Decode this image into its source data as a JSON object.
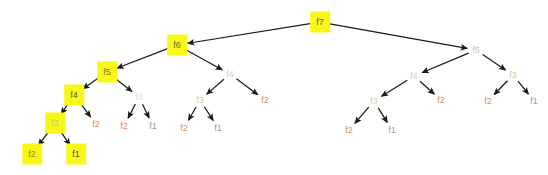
{
  "figure": {
    "kind": "recursion-tree",
    "background": "#ffffff",
    "edge_color": "#1a1a1a",
    "highlight_color": "#f7f718"
  },
  "palette": {
    "highlight_bg": "#f7f718",
    "label_f7": "#6b6b20",
    "label_f6": "#6b6b20",
    "label_f5_hl": "#7a7a28",
    "label_f4_hl": "#5c5c1a",
    "label_f3_hl": "#c9c95a",
    "label_f2_hl": "#b8741f",
    "label_f1_hl": "#4a4a4a",
    "label_f5_plain": "#b8c4cc",
    "label_f4_plain": "#d8cfae",
    "label_f3_plain": "#e0c9a0",
    "label_f2_plain": "#e08a6a",
    "label_f1_plain": "#9a9a9a"
  },
  "nodes": [
    {
      "id": "n0",
      "label": "f7",
      "x": 320,
      "y": 22,
      "highlight": true,
      "color": "#6b6b20"
    },
    {
      "id": "n1",
      "label": "f6",
      "x": 177,
      "y": 45,
      "highlight": true,
      "color": "#6b6b20"
    },
    {
      "id": "n2",
      "label": "f5",
      "x": 476,
      "y": 50,
      "highlight": false,
      "color": "#b8c4cc"
    },
    {
      "id": "n3",
      "label": "f5",
      "x": 107,
      "y": 72,
      "highlight": true,
      "color": "#7a7a28"
    },
    {
      "id": "n4",
      "label": "f4",
      "x": 230,
      "y": 74,
      "highlight": false,
      "color": "#d8cfae"
    },
    {
      "id": "n5",
      "label": "f4",
      "x": 414,
      "y": 76,
      "highlight": false,
      "color": "#d8cfae"
    },
    {
      "id": "n6",
      "label": "f3",
      "x": 513,
      "y": 75,
      "highlight": false,
      "color": "#e0c9a0"
    },
    {
      "id": "n7",
      "label": "f4",
      "x": 74,
      "y": 95,
      "highlight": true,
      "color": "#5c5c1a"
    },
    {
      "id": "n8",
      "label": "f3",
      "x": 139,
      "y": 97,
      "highlight": false,
      "color": "#e8dcb8"
    },
    {
      "id": "n9",
      "label": "f3",
      "x": 200,
      "y": 100,
      "highlight": false,
      "color": "#e0c9a0"
    },
    {
      "id": "n10",
      "label": "f2",
      "x": 265,
      "y": 100,
      "highlight": false,
      "color": "#e08a6a"
    },
    {
      "id": "n11",
      "label": "f3",
      "x": 374,
      "y": 101,
      "highlight": false,
      "color": "#e0c9a0"
    },
    {
      "id": "n12",
      "label": "f2",
      "x": 441,
      "y": 100,
      "highlight": false,
      "color": "#e08a6a"
    },
    {
      "id": "n13",
      "label": "f2",
      "x": 488,
      "y": 101,
      "highlight": false,
      "color": "#e08a6a"
    },
    {
      "id": "n14",
      "label": "f1",
      "x": 534,
      "y": 101,
      "highlight": false,
      "color": "#9a9a9a"
    },
    {
      "id": "n15",
      "label": "f3",
      "x": 55,
      "y": 123,
      "highlight": true,
      "color": "#c9c95a"
    },
    {
      "id": "n16",
      "label": "f2",
      "x": 96,
      "y": 124,
      "highlight": false,
      "color": "#e08a6a"
    },
    {
      "id": "n17",
      "label": "f2",
      "x": 124,
      "y": 126,
      "highlight": false,
      "color": "#e08a6a"
    },
    {
      "id": "n18",
      "label": "f1",
      "x": 153,
      "y": 126,
      "highlight": false,
      "color": "#9a9a9a"
    },
    {
      "id": "n19",
      "label": "f2",
      "x": 184,
      "y": 128,
      "highlight": false,
      "color": "#e08a6a"
    },
    {
      "id": "n20",
      "label": "f1",
      "x": 218,
      "y": 128,
      "highlight": false,
      "color": "#9a9a9a"
    },
    {
      "id": "n21",
      "label": "f2",
      "x": 349,
      "y": 130,
      "highlight": false,
      "color": "#e08a6a"
    },
    {
      "id": "n22",
      "label": "f1",
      "x": 392,
      "y": 130,
      "highlight": false,
      "color": "#9a9a9a"
    },
    {
      "id": "n23",
      "label": "f2",
      "x": 32,
      "y": 154,
      "highlight": true,
      "color": "#b8741f"
    },
    {
      "id": "n24",
      "label": "f1",
      "x": 76,
      "y": 154,
      "highlight": true,
      "color": "#4a4a4a"
    }
  ],
  "edges": [
    {
      "from": "n0",
      "to": "n1"
    },
    {
      "from": "n0",
      "to": "n2"
    },
    {
      "from": "n1",
      "to": "n3"
    },
    {
      "from": "n1",
      "to": "n4"
    },
    {
      "from": "n2",
      "to": "n5"
    },
    {
      "from": "n2",
      "to": "n6"
    },
    {
      "from": "n3",
      "to": "n7"
    },
    {
      "from": "n3",
      "to": "n8"
    },
    {
      "from": "n4",
      "to": "n9"
    },
    {
      "from": "n4",
      "to": "n10"
    },
    {
      "from": "n5",
      "to": "n11"
    },
    {
      "from": "n5",
      "to": "n12"
    },
    {
      "from": "n6",
      "to": "n13"
    },
    {
      "from": "n6",
      "to": "n14"
    },
    {
      "from": "n7",
      "to": "n15"
    },
    {
      "from": "n7",
      "to": "n16"
    },
    {
      "from": "n8",
      "to": "n17"
    },
    {
      "from": "n8",
      "to": "n18"
    },
    {
      "from": "n9",
      "to": "n19"
    },
    {
      "from": "n9",
      "to": "n20"
    },
    {
      "from": "n11",
      "to": "n21"
    },
    {
      "from": "n11",
      "to": "n22"
    },
    {
      "from": "n15",
      "to": "n23"
    },
    {
      "from": "n15",
      "to": "n24"
    }
  ]
}
